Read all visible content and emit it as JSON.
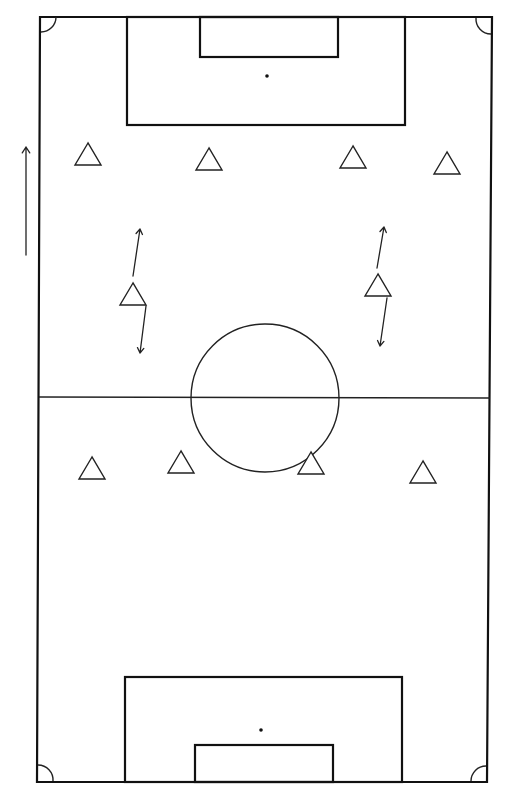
{
  "diagram": {
    "type": "soccer-pitch-drill",
    "colors": {
      "background": "#ffffff",
      "lines": "#111111"
    },
    "field": {
      "x1_top": 40,
      "x2_top": 492,
      "x1_bottom": 37,
      "x2_bottom": 487,
      "y_top": 17,
      "y_bottom": 782
    },
    "halfway_line_y": 397,
    "center_circle": {
      "cx": 265,
      "cy": 398,
      "r": 74
    },
    "top_penalty_area": {
      "x": 127,
      "y": 17,
      "w": 278,
      "h": 108
    },
    "top_goal_area": {
      "x": 200,
      "y": 17,
      "w": 138,
      "h": 40
    },
    "top_penalty_spot": {
      "cx": 267,
      "cy": 76
    },
    "bottom_penalty_area": {
      "x": 125,
      "y": 677,
      "w": 277,
      "h": 105
    },
    "bottom_goal_area": {
      "x": 195,
      "y": 745,
      "w": 138,
      "h": 37
    },
    "bottom_penalty_spot": {
      "cx": 261,
      "cy": 730
    },
    "direction_arrow": {
      "x": 26,
      "y_from": 255,
      "y_to": 147,
      "direction": "up"
    },
    "cones": [
      {
        "id": "top-row-1",
        "cx": 88,
        "cy": 154
      },
      {
        "id": "top-row-2",
        "cx": 209,
        "cy": 159
      },
      {
        "id": "top-row-3",
        "cx": 353,
        "cy": 157
      },
      {
        "id": "top-row-4",
        "cx": 447,
        "cy": 163
      },
      {
        "id": "mid-left",
        "cx": 133,
        "cy": 294
      },
      {
        "id": "mid-right",
        "cx": 378,
        "cy": 285
      },
      {
        "id": "bottom-row-1",
        "cx": 92,
        "cy": 468
      },
      {
        "id": "bottom-row-2",
        "cx": 181,
        "cy": 462
      },
      {
        "id": "bottom-row-3",
        "cx": 311,
        "cy": 463
      },
      {
        "id": "bottom-row-4",
        "cx": 423,
        "cy": 472
      }
    ],
    "movement_arrows": [
      {
        "id": "left-up",
        "x1": 133,
        "y1": 276,
        "x2": 140,
        "y2": 229
      },
      {
        "id": "left-down",
        "x1": 146,
        "y1": 306,
        "x2": 140,
        "y2": 353
      },
      {
        "id": "right-up",
        "x1": 377,
        "y1": 268,
        "x2": 384,
        "y2": 227
      },
      {
        "id": "right-down",
        "x1": 387,
        "y1": 298,
        "x2": 380,
        "y2": 346
      }
    ]
  }
}
